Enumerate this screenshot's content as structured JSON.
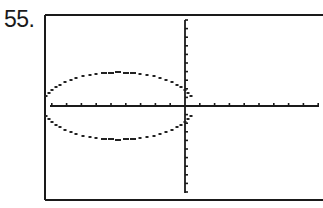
{
  "problem": {
    "number_label": "55."
  },
  "chart_data": {
    "type": "scatter",
    "title": "",
    "xlabel": "",
    "ylabel": "",
    "grid": false,
    "x_ticks_count_left": 9,
    "x_ticks_count_right": 9,
    "y_ticks_count_up": 10,
    "y_ticks_count_down": 10,
    "ellipse": {
      "center_x_ticks": -4.5,
      "center_y_ticks": 0,
      "semi_axis_x_ticks": 5.1,
      "semi_axis_y_ticks": 3.3
    },
    "colors": {
      "frame": "#1a1a1a",
      "axes": "#1a1a1a",
      "curve": "#222222",
      "background": "#ffffff"
    }
  }
}
